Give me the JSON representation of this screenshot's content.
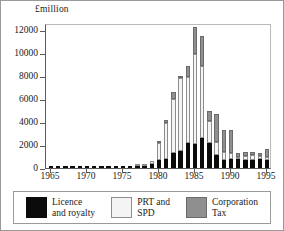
{
  "figure": {
    "y_axis_caption": "£million"
  },
  "legend": {
    "items": [
      {
        "label_line1": "Licence",
        "label_line2": "and royalty",
        "color": "#0b0b0b",
        "swatch": "black-solid"
      },
      {
        "label_line1": "PRT and",
        "label_line2": "SPD",
        "color": "#f4f4f4",
        "swatch": "white-outline"
      },
      {
        "label_line1": "Corporation",
        "label_line2": "Tax",
        "color": "#8f8f8f",
        "swatch": "grey-dotted"
      }
    ]
  },
  "chart_data": {
    "type": "bar",
    "stacked": true,
    "title": "",
    "subtitle": "",
    "xlabel": "",
    "ylabel": "£million",
    "ylim": [
      0,
      12600
    ],
    "yticks": [
      0,
      2000,
      4000,
      6000,
      8000,
      10000,
      12000
    ],
    "ytick_labels": [
      "0",
      "2000",
      "4000",
      "6000",
      "8000",
      "10000",
      "12000"
    ],
    "xticks": [
      1965,
      1970,
      1975,
      1980,
      1985,
      1990,
      1995
    ],
    "xtick_labels": [
      "1965",
      "1970",
      "1975",
      "1980",
      "1985",
      "1990",
      "1995"
    ],
    "xlim": [
      1964.3,
      1995.7
    ],
    "grid": false,
    "legend_position": "bottom",
    "categories": [
      1965,
      1966,
      1967,
      1968,
      1969,
      1970,
      1971,
      1972,
      1973,
      1974,
      1975,
      1976,
      1977,
      1978,
      1979,
      1980,
      1981,
      1982,
      1983,
      1984,
      1985,
      1986,
      1987,
      1988,
      1989,
      1990,
      1991,
      1992,
      1993,
      1994,
      1995
    ],
    "series": [
      {
        "name": "Licence and royalty",
        "color": "#0b0b0b",
        "values": [
          2,
          3,
          4,
          5,
          6,
          8,
          10,
          12,
          14,
          16,
          20,
          25,
          60,
          180,
          320,
          700,
          780,
          1340,
          1480,
          2170,
          2060,
          2610,
          2180,
          1150,
          730,
          760,
          740,
          700,
          710,
          760,
          680
        ]
      },
      {
        "name": "PRT and SPD",
        "color": "#f4f4f4",
        "values": [
          0,
          0,
          0,
          0,
          0,
          0,
          0,
          0,
          0,
          0,
          0,
          0,
          20,
          90,
          330,
          1520,
          3140,
          4680,
          6340,
          5730,
          7890,
          6250,
          1940,
          1130,
          670,
          560,
          230,
          350,
          400,
          300,
          280
        ]
      },
      {
        "name": "Corporation Tax",
        "color": "#8f8f8f",
        "values": [
          0,
          0,
          0,
          0,
          0,
          0,
          0,
          0,
          0,
          0,
          0,
          0,
          0,
          0,
          0,
          120,
          280,
          620,
          180,
          990,
          2310,
          2600,
          800,
          2410,
          1890,
          2000,
          350,
          340,
          250,
          260,
          700
        ]
      }
    ],
    "totals": [
      2,
      3,
      4,
      5,
      6,
      8,
      10,
      12,
      14,
      16,
      20,
      25,
      80,
      270,
      650,
      2340,
      4200,
      6640,
      8000,
      8890,
      12260,
      11460,
      4920,
      4690,
      3290,
      3320,
      1320,
      1390,
      1360,
      1320,
      1660
    ]
  }
}
